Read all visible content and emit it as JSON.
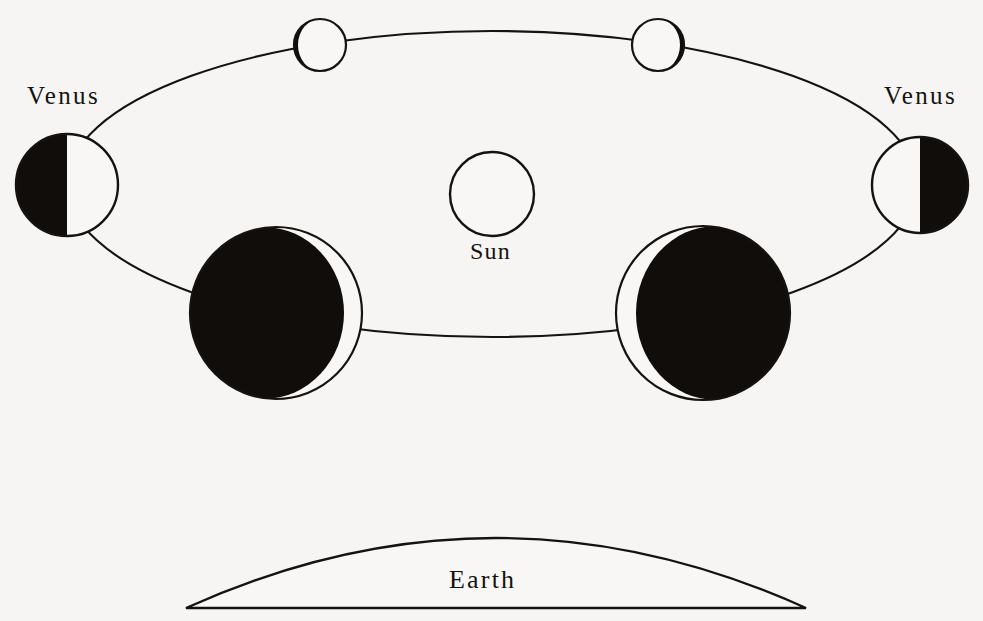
{
  "figure": {
    "background_color": "#f6f5f3",
    "ink_color": "#15120f",
    "lit_color": "#f8f7f5",
    "dark_color": "#100d0b"
  },
  "labels": {
    "venus_left": "Venus",
    "venus_right": "Venus",
    "sun": "Sun",
    "earth": "Earth"
  },
  "sun": {
    "name": "Sun",
    "cx": 492,
    "cy": 194,
    "r": 42,
    "fill": "white"
  },
  "orbit": {
    "name": "venus-orbit",
    "cx": 492,
    "cy": 184,
    "rx": 425,
    "ry": 153,
    "stroke": "#15120f"
  },
  "earth": {
    "name": "Earth",
    "left_x": 186,
    "right_x": 806,
    "base_y": 608,
    "apex_y": 517
  },
  "phases": [
    {
      "id": "venus-top-left",
      "position": "upper-left",
      "cx": 320,
      "cy": 45,
      "r": 26,
      "phase": "waxing-gibbous-near-full",
      "illuminated_fraction": 0.86,
      "dark_side": "left",
      "label": null
    },
    {
      "id": "venus-top-right",
      "position": "upper-right",
      "cx": 658,
      "cy": 45,
      "r": 26,
      "phase": "waning-gibbous-near-full",
      "illuminated_fraction": 0.86,
      "dark_side": "right",
      "label": null
    },
    {
      "id": "venus-far-left",
      "position": "left-elongation",
      "cx": 67,
      "cy": 185,
      "r": 51,
      "phase": "half-quarter",
      "illuminated_fraction": 0.5,
      "dark_side": "left",
      "label": "Venus"
    },
    {
      "id": "venus-far-right",
      "position": "right-elongation",
      "cx": 920,
      "cy": 185,
      "r": 48,
      "phase": "half-quarter",
      "illuminated_fraction": 0.5,
      "dark_side": "right",
      "label": "Venus"
    },
    {
      "id": "venus-lower-left",
      "position": "lower-left-near-earth",
      "cx": 276,
      "cy": 313,
      "r": 86,
      "phase": "thin-crescent",
      "illuminated_fraction": 0.1,
      "dark_side": "left",
      "label": null
    },
    {
      "id": "venus-lower-right",
      "position": "lower-right-near-earth",
      "cx": 703,
      "cy": 313,
      "r": 87,
      "phase": "thin-crescent",
      "illuminated_fraction": 0.1,
      "dark_side": "right",
      "label": null
    }
  ],
  "label_positions": {
    "venus_left": {
      "x": 27,
      "y": 104
    },
    "venus_right": {
      "x": 884,
      "y": 104
    },
    "sun": {
      "x": 470,
      "y": 259
    },
    "earth": {
      "x": 449,
      "y": 588
    }
  }
}
